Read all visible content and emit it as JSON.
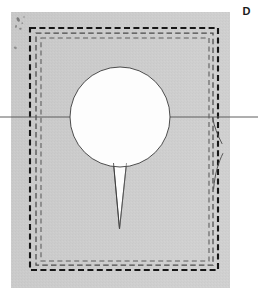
{
  "figure": {
    "panel_label": "D",
    "caption_text": "",
    "background_color": "#ffffff",
    "plate_color": "#c9c9c9",
    "plate_color_light": "#d3d3d3",
    "ink_dark": "#1f1f1f",
    "ink_mid": "#5a5a5a",
    "ink_light": "#7d7d7d",
    "aperture_color": "#fdfdfd",
    "plate": {
      "name": "gray-plate",
      "x": 11,
      "y": 12,
      "width": 219,
      "height": 276
    },
    "frames": [
      {
        "name": "outer-dashed-frame",
        "x": 30,
        "y": 28,
        "width": 188,
        "height": 242,
        "stroke": "#161616",
        "stroke_width": 2.1,
        "dash": "6 3.4"
      },
      {
        "name": "middle-dashed-frame",
        "x": 36,
        "y": 33,
        "width": 177,
        "height": 232,
        "stroke": "#4a4a4a",
        "stroke_width": 1.25,
        "dash": "5.5 3.2"
      },
      {
        "name": "inner-dashed-frame",
        "x": 41,
        "y": 38,
        "width": 168,
        "height": 223,
        "stroke": "#5d5d5d",
        "stroke_width": 1.1,
        "dash": "5 3.4"
      }
    ],
    "aperture": {
      "name": "circular-aperture",
      "cx": 120,
      "cy": 117,
      "r": 50,
      "fill": "#fdfdfd",
      "stroke": "#3a3a3a",
      "stroke_width": 0.9
    },
    "tail": {
      "name": "aperture-tail-wedge",
      "top_left_x": 113.5,
      "top_right_x": 126.5,
      "top_y": 163,
      "tip_x": 119.5,
      "tip_y": 229,
      "fill": "#fdfdfd",
      "stroke": "#3a3a3a",
      "stroke_width": 0.85
    },
    "horizontal_line": {
      "name": "horizontal-reference-line",
      "y": 117,
      "x_start": 0,
      "x_end": 258,
      "stroke": "#5e5e5e",
      "stroke_width": 1.0
    },
    "crack_curves": [
      {
        "name": "crack-curve-upper",
        "path": "M 212.6 117.8 C 214.2 126.5 217.4 135.0 222.0 143.6",
        "stroke": "#4f4f4f",
        "stroke_width": 0.95
      },
      {
        "name": "crack-curve-lower",
        "path": "M 222.8 153.6 C 218.6 162.2 214.9 173.0 213.6 189.0",
        "stroke": "#4f4f4f",
        "stroke_width": 0.95
      }
    ],
    "specks": [
      {
        "name": "speck-1",
        "cx": 18.2,
        "cy": 19.5,
        "rx": 1.5,
        "ry": 2.4,
        "rot": -24,
        "fill": "#6e6e6e"
      },
      {
        "name": "speck-2",
        "cx": 16.0,
        "cy": 26.4,
        "rx": 1.0,
        "ry": 1.5,
        "rot": 12,
        "fill": "#7a7a7a"
      },
      {
        "name": "speck-3",
        "cx": 20.4,
        "cy": 28.8,
        "rx": 1.3,
        "ry": 1.0,
        "rot": 0,
        "fill": "#767676"
      },
      {
        "name": "speck-4",
        "cx": 22.3,
        "cy": 23.2,
        "rx": 0.9,
        "ry": 0.9,
        "rot": 0,
        "fill": "#848484"
      },
      {
        "name": "speck-5",
        "cx": 15.3,
        "cy": 47.8,
        "rx": 1.6,
        "ry": 1.2,
        "rot": 30,
        "fill": "#7b7b7b"
      },
      {
        "name": "speck-6",
        "cx": 24.0,
        "cy": 17.0,
        "rx": 0.8,
        "ry": 1.1,
        "rot": 0,
        "fill": "#8a8a8a"
      }
    ]
  }
}
